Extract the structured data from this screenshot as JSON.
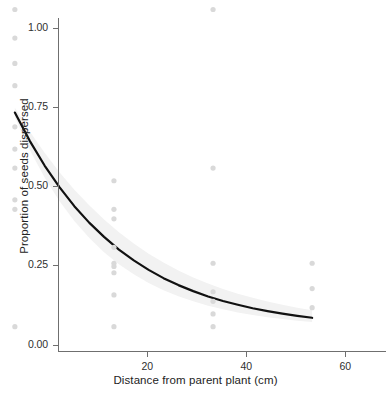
{
  "chart_data": {
    "type": "scatter",
    "title": "",
    "xlabel": "Distance from parent plant (cm)",
    "ylabel": "Proportion of seeds dispersed",
    "xlim": [
      2,
      68
    ],
    "ylim": [
      -0.02,
      1.03
    ],
    "xticks": [
      20,
      40,
      60
    ],
    "xticklabels": [
      "20",
      "40",
      "60"
    ],
    "yticks": [
      0.0,
      0.25,
      0.5,
      0.75,
      1.0
    ],
    "yticklabels": [
      "0.00",
      "0.25",
      "0.50",
      "0.75",
      "1.00"
    ],
    "grid": false,
    "legend": null,
    "point_color": "#d9d9d9",
    "line_color": "#111111",
    "band_color": "#f0f0f0",
    "axis_color": "#6f6f6f",
    "points": [
      {
        "x": 5,
        "y": 1.0
      },
      {
        "x": 5,
        "y": 0.91
      },
      {
        "x": 5,
        "y": 0.83
      },
      {
        "x": 5,
        "y": 0.76
      },
      {
        "x": 5,
        "y": 0.63
      },
      {
        "x": 5,
        "y": 0.56
      },
      {
        "x": 5,
        "y": 0.5
      },
      {
        "x": 5,
        "y": 0.4
      },
      {
        "x": 5,
        "y": 0.37
      },
      {
        "x": 5,
        "y": 0.0
      },
      {
        "x": 25,
        "y": 0.46
      },
      {
        "x": 25,
        "y": 0.37
      },
      {
        "x": 25,
        "y": 0.34
      },
      {
        "x": 25,
        "y": 0.25
      },
      {
        "x": 25,
        "y": 0.2
      },
      {
        "x": 25,
        "y": 0.19
      },
      {
        "x": 25,
        "y": 0.17
      },
      {
        "x": 25,
        "y": 0.1
      },
      {
        "x": 25,
        "y": 0.0
      },
      {
        "x": 45,
        "y": 1.0
      },
      {
        "x": 45,
        "y": 0.5
      },
      {
        "x": 45,
        "y": 0.2
      },
      {
        "x": 45,
        "y": 0.11
      },
      {
        "x": 45,
        "y": 0.08
      },
      {
        "x": 45,
        "y": 0.04
      },
      {
        "x": 45,
        "y": 0.0
      },
      {
        "x": 65,
        "y": 0.2
      },
      {
        "x": 65,
        "y": 0.12
      },
      {
        "x": 65,
        "y": 0.06
      }
    ],
    "fit_curve": {
      "description": "exponential decay fit of proportion dispersed vs distance",
      "x": [
        5,
        8,
        11,
        14,
        17,
        20,
        23,
        26,
        29,
        32,
        35,
        38,
        41,
        44,
        47,
        50,
        53,
        56,
        59,
        62,
        65
      ],
      "y": [
        0.675,
        0.586,
        0.508,
        0.44,
        0.38,
        0.328,
        0.283,
        0.243,
        0.209,
        0.179,
        0.153,
        0.131,
        0.112,
        0.095,
        0.081,
        0.069,
        0.058,
        0.049,
        0.041,
        0.034,
        0.028
      ]
    },
    "confidence_band": {
      "x": [
        5,
        8,
        11,
        14,
        17,
        20,
        23,
        26,
        29,
        32,
        35,
        38,
        41,
        44,
        47,
        50,
        53,
        56,
        59,
        62,
        65
      ],
      "upper": [
        0.69,
        0.615,
        0.548,
        0.487,
        0.432,
        0.383,
        0.338,
        0.298,
        0.262,
        0.23,
        0.202,
        0.177,
        0.155,
        0.136,
        0.119,
        0.104,
        0.091,
        0.079,
        0.069,
        0.06,
        0.052
      ],
      "lower": [
        0.66,
        0.558,
        0.47,
        0.396,
        0.333,
        0.28,
        0.235,
        0.197,
        0.165,
        0.138,
        0.115,
        0.096,
        0.08,
        0.066,
        0.055,
        0.045,
        0.037,
        0.03,
        0.024,
        0.019,
        0.015
      ]
    }
  }
}
